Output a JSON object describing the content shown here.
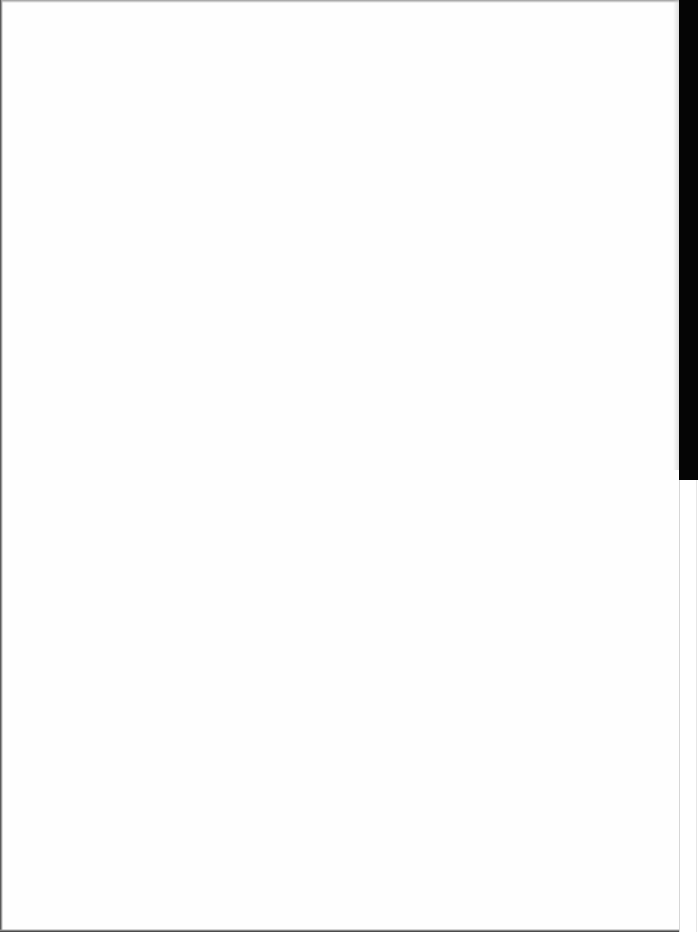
{
  "document": {
    "type": "blank scanned page",
    "text_content": "",
    "colors": {
      "paper": "#fefefe",
      "scanner_edge": "#050505",
      "border_line": "#d6d6d6"
    }
  }
}
